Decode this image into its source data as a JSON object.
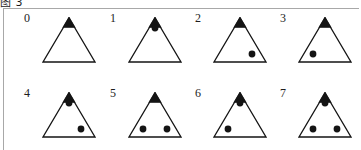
{
  "figure": {
    "caption": "图 3",
    "background_color": "#ffffff",
    "frame_color": "#a8a8a8",
    "ink_color": "#141414",
    "rows": 2,
    "columns": 4
  },
  "legend": {
    "apex_marker_name": "filled-apex-triangle",
    "dot_marker_name": "filled-circle",
    "dot_positions": [
      "top",
      "bottom-left",
      "bottom-right"
    ]
  },
  "items": [
    {
      "label": "0",
      "dots": [],
      "dot_count": 0,
      "top": false,
      "bottom_left": false,
      "bottom_right": false
    },
    {
      "label": "1",
      "dots": [
        "top"
      ],
      "dot_count": 1,
      "top": true,
      "bottom_left": false,
      "bottom_right": false
    },
    {
      "label": "2",
      "dots": [
        "bottom-right"
      ],
      "dot_count": 1,
      "top": false,
      "bottom_left": false,
      "bottom_right": true
    },
    {
      "label": "3",
      "dots": [
        "bottom-left"
      ],
      "dot_count": 1,
      "top": false,
      "bottom_left": true,
      "bottom_right": false
    },
    {
      "label": "4",
      "dots": [
        "top",
        "bottom-right"
      ],
      "dot_count": 2,
      "top": true,
      "bottom_left": false,
      "bottom_right": true
    },
    {
      "label": "5",
      "dots": [
        "bottom-left",
        "bottom-right"
      ],
      "dot_count": 2,
      "top": false,
      "bottom_left": true,
      "bottom_right": true
    },
    {
      "label": "6",
      "dots": [
        "top",
        "bottom-left"
      ],
      "dot_count": 2,
      "top": true,
      "bottom_left": true,
      "bottom_right": false
    },
    {
      "label": "7",
      "dots": [
        "top",
        "bottom-left",
        "bottom-right"
      ],
      "dot_count": 3,
      "top": true,
      "bottom_left": true,
      "bottom_right": true
    }
  ]
}
